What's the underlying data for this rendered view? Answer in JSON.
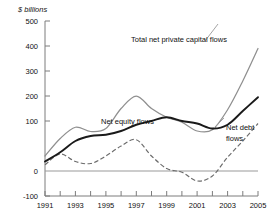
{
  "chart_data": {
    "type": "line",
    "title": "",
    "subtitle": "",
    "ylabel": "$ billions",
    "xlabel": "",
    "ylim": [
      -100,
      500
    ],
    "xlim": [
      1991,
      2005
    ],
    "grid": false,
    "legend_position": "inline-annotations",
    "y_ticks": [
      500,
      400,
      300,
      200,
      100,
      0,
      -100
    ],
    "y_tick_labels": [
      "500",
      "400",
      "300",
      "200",
      "100",
      "0",
      "-100"
    ],
    "x_ticks": [
      1991,
      1992,
      1993,
      1994,
      1995,
      1996,
      1997,
      1998,
      1999,
      2000,
      2001,
      2002,
      2003,
      2004,
      2005
    ],
    "x_tick_labels": [
      "1991",
      "",
      "1993",
      "",
      "1995",
      "",
      "1997",
      "",
      "1999",
      "",
      "2001",
      "",
      "2003",
      "",
      "2005"
    ],
    "x": [
      1991,
      1992,
      1993,
      1994,
      1995,
      1996,
      1997,
      1998,
      1999,
      2000,
      2001,
      2002,
      2003,
      2004,
      2005
    ],
    "series": [
      {
        "name": "Total net private capital flows",
        "style": "solid-gray",
        "color": "#8f8f8f",
        "values": [
          60,
          130,
          175,
          158,
          170,
          250,
          300,
          250,
          215,
          195,
          160,
          165,
          245,
          360,
          490
        ]
      },
      {
        "name": "Net equity flows",
        "style": "solid-black-thick",
        "color": "#1a1a1a",
        "values": [
          38,
          75,
          120,
          140,
          145,
          160,
          185,
          200,
          215,
          200,
          190,
          170,
          185,
          240,
          295
        ]
      },
      {
        "name": "Net debt flows",
        "style": "dashed-gray",
        "color": "#6b6b6b",
        "values": [
          25,
          68,
          38,
          30,
          60,
          100,
          125,
          60,
          10,
          -5,
          -40,
          -20,
          55,
          120,
          190
        ]
      }
    ],
    "annotations": [
      {
        "name": "total-net-private-capital-flows-label",
        "text": "Total net private capital flows",
        "series": "Total net private capital flows"
      },
      {
        "name": "net-equity-flows-label",
        "text": "Net equity flows",
        "series": "Net equity flows"
      },
      {
        "name": "net-debt-flows-label-line1",
        "text": "Net debt",
        "series": "Net debt flows"
      },
      {
        "name": "net-debt-flows-label-line2",
        "text": "flows",
        "series": "Net debt flows"
      }
    ]
  },
  "labels": {
    "y_axis_title": "$ billions",
    "total": "Total net private capital flows",
    "equity": "Net equity flows",
    "debt_line1": "Net debt",
    "debt_line2": "flows",
    "y0": "500",
    "y1": "400",
    "y2": "300",
    "y3": "200",
    "y4": "100",
    "y5": "0",
    "y6": "-100",
    "x1991": "1991",
    "x1993": "1993",
    "x1995": "1995",
    "x1997": "1997",
    "x1999": "1999",
    "x2001": "2001",
    "x2003": "2003",
    "x2005": "2005"
  }
}
